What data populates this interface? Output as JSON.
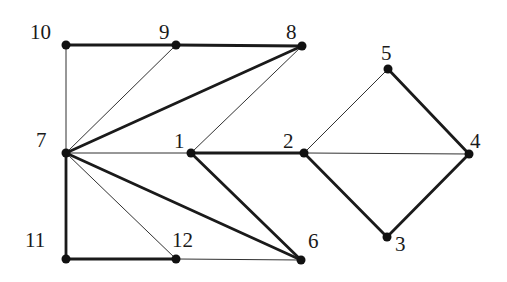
{
  "diagram": {
    "type": "graph",
    "nodes": [
      {
        "id": "1",
        "x": 191,
        "y": 153,
        "label_x": 174,
        "label_y": 131
      },
      {
        "id": "2",
        "x": 304,
        "y": 153,
        "label_x": 283,
        "label_y": 131
      },
      {
        "id": "3",
        "x": 387,
        "y": 237,
        "label_x": 395,
        "label_y": 234
      },
      {
        "id": "4",
        "x": 469,
        "y": 154,
        "label_x": 470,
        "label_y": 131
      },
      {
        "id": "5",
        "x": 388,
        "y": 69,
        "label_x": 381,
        "label_y": 43
      },
      {
        "id": "6",
        "x": 301,
        "y": 260,
        "label_x": 308,
        "label_y": 231
      },
      {
        "id": "7",
        "x": 66,
        "y": 153,
        "label_x": 36,
        "label_y": 130
      },
      {
        "id": "8",
        "x": 302,
        "y": 46,
        "label_x": 286,
        "label_y": 22
      },
      {
        "id": "9",
        "x": 176,
        "y": 45,
        "label_x": 159,
        "label_y": 22
      },
      {
        "id": "10",
        "x": 66,
        "y": 45,
        "label_x": 30,
        "label_y": 22
      },
      {
        "id": "11",
        "x": 66,
        "y": 259,
        "label_x": 25,
        "label_y": 230
      },
      {
        "id": "12",
        "x": 176,
        "y": 259,
        "label_x": 172,
        "label_y": 230
      }
    ],
    "edges": [
      {
        "from": "10",
        "to": "9",
        "weight": "thick"
      },
      {
        "from": "9",
        "to": "8",
        "weight": "thick"
      },
      {
        "from": "10",
        "to": "7",
        "weight": "thin"
      },
      {
        "from": "9",
        "to": "7",
        "weight": "thin"
      },
      {
        "from": "8",
        "to": "7",
        "weight": "thick"
      },
      {
        "from": "8",
        "to": "1",
        "weight": "thin"
      },
      {
        "from": "7",
        "to": "1",
        "weight": "thin"
      },
      {
        "from": "1",
        "to": "2",
        "weight": "thick"
      },
      {
        "from": "7",
        "to": "6",
        "weight": "thick"
      },
      {
        "from": "1",
        "to": "6",
        "weight": "thick"
      },
      {
        "from": "7",
        "to": "12",
        "weight": "thin"
      },
      {
        "from": "7",
        "to": "11",
        "weight": "thick"
      },
      {
        "from": "11",
        "to": "12",
        "weight": "thick"
      },
      {
        "from": "12",
        "to": "6",
        "weight": "thin"
      },
      {
        "from": "2",
        "to": "5",
        "weight": "thin"
      },
      {
        "from": "5",
        "to": "4",
        "weight": "thick"
      },
      {
        "from": "2",
        "to": "4",
        "weight": "thin"
      },
      {
        "from": "2",
        "to": "3",
        "weight": "thick"
      },
      {
        "from": "3",
        "to": "4",
        "weight": "thick"
      }
    ],
    "style": {
      "edge_color": "#1a1a1a",
      "thin_width": 0.9,
      "thick_width": 2.8,
      "node_radius": 4.5,
      "node_color": "#111111"
    }
  }
}
